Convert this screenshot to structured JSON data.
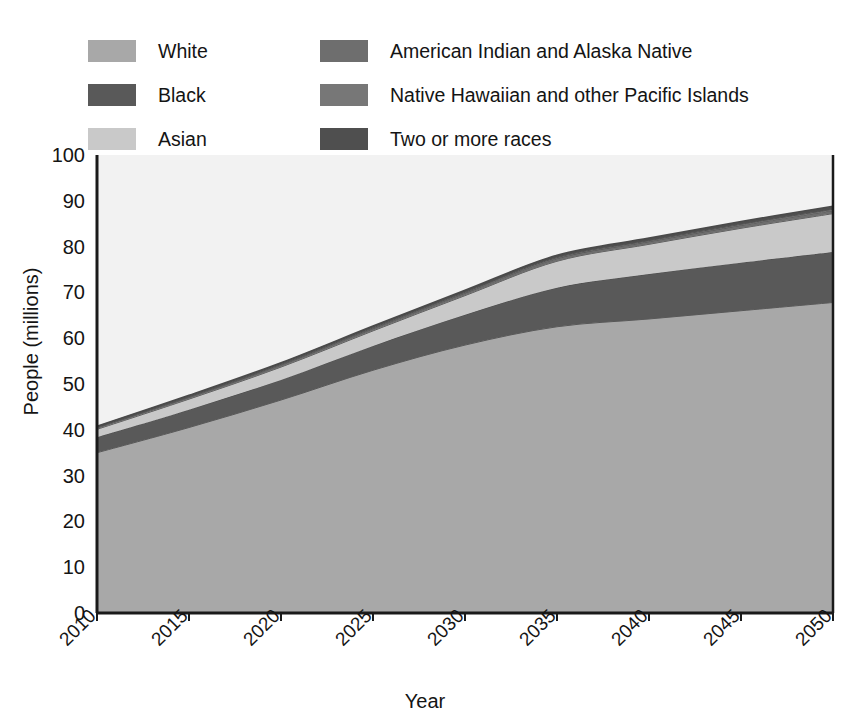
{
  "chart_data": {
    "type": "area",
    "stacked": true,
    "title": "",
    "subtitle": "",
    "xlabel": "Year",
    "ylabel": "People (millions)",
    "xlim": [
      2010,
      2050
    ],
    "ylim": [
      0,
      100
    ],
    "xticks": [
      "2010",
      "2015",
      "2020",
      "2025",
      "2030",
      "2035",
      "2040",
      "2045",
      "2050"
    ],
    "yticks": [
      "0",
      "10",
      "20",
      "30",
      "40",
      "50",
      "60",
      "70",
      "80",
      "90",
      "100"
    ],
    "grid": false,
    "legend_position": "top",
    "x": [
      2010,
      2015,
      2020,
      2025,
      2030,
      2035,
      2040,
      2045,
      2050
    ],
    "series": [
      {
        "name": "White",
        "color": "#a8a8a8",
        "values": [
          35.0,
          40.5,
          46.5,
          53.0,
          58.5,
          62.5,
          64.2,
          66.0,
          67.8
        ]
      },
      {
        "name": "Black",
        "color": "#595959",
        "values": [
          3.4,
          3.9,
          4.4,
          5.3,
          6.6,
          8.5,
          9.8,
          10.5,
          11.0
        ]
      },
      {
        "name": "Asian",
        "color": "#c9c9c9",
        "values": [
          1.7,
          2.3,
          2.8,
          3.3,
          4.2,
          5.8,
          6.5,
          7.5,
          8.4
        ]
      },
      {
        "name": "American Indian and Alaska Native",
        "color": "#6e6e6e",
        "values": [
          0.35,
          0.4,
          0.45,
          0.5,
          0.55,
          0.6,
          0.6,
          0.65,
          0.7
        ]
      },
      {
        "name": "Native Hawaiian and other Pacific Islands",
        "color": "#777777",
        "values": [
          0.1,
          0.12,
          0.14,
          0.16,
          0.18,
          0.2,
          0.2,
          0.22,
          0.25
        ]
      },
      {
        "name": "Two or more races",
        "color": "#4f4f4f",
        "values": [
          0.25,
          0.3,
          0.35,
          0.4,
          0.45,
          0.5,
          0.55,
          0.6,
          0.65
        ]
      }
    ],
    "totals": [
      40.8,
      47.5,
      54.6,
      62.7,
      70.5,
      78.1,
      81.9,
      85.5,
      88.8
    ]
  },
  "legend": {
    "items": [
      {
        "label": "White",
        "color": "#a8a8a8"
      },
      {
        "label": "Black",
        "color": "#595959"
      },
      {
        "label": "Asian",
        "color": "#c9c9c9"
      },
      {
        "label": "American Indian and Alaska Native",
        "color": "#6e6e6e"
      },
      {
        "label": "Native Hawaiian and other Pacific Islands",
        "color": "#777777"
      },
      {
        "label": "Two or more races",
        "color": "#4f4f4f"
      }
    ]
  },
  "axes": {
    "x_title": "Year",
    "y_title": "People (millions)"
  },
  "colors": {
    "axis": "#1a1a1a",
    "background": "#ffffff",
    "plot_background": "#f2f2f2"
  }
}
